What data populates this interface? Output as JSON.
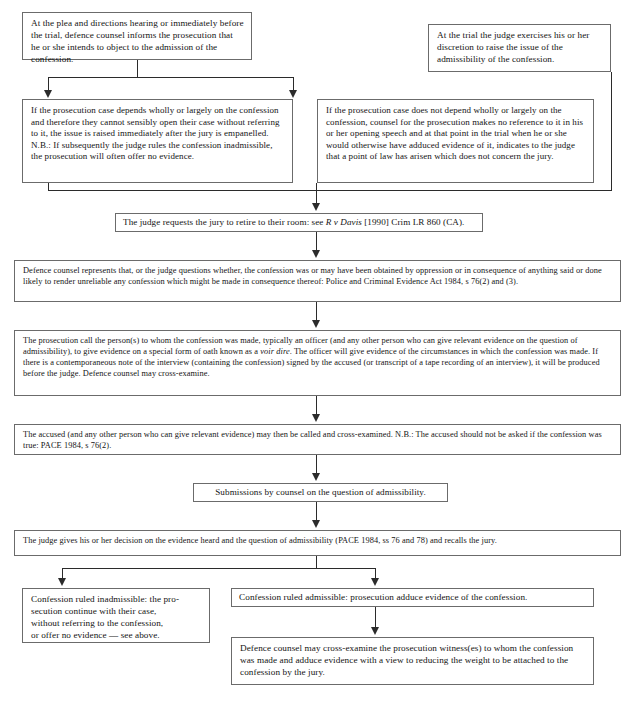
{
  "document": {
    "type": "flowchart",
    "title": "Procedure for determining the admissibility of a confession",
    "orientation": "top-to-bottom"
  },
  "nodes": {
    "plea_hearing": {
      "id": "plea-hearing",
      "text": "At the plea and directions hearing or immediately before the trial, defence counsel informs the prosecution that he or she intends to object to the admission of the confession."
    },
    "at_trial": {
      "id": "at-trial",
      "text": "At the trial the judge exercises his or her discretion to raise the issue of the admissibility of the confession."
    },
    "depends_wholly": {
      "id": "depends-wholly",
      "text": "If the prosecution case depends wholly or largely on the confession and therefore they cannot sensibly open their case without referring to it, the issue is raised immediately after the jury is empanelled. N.B.: If subsequently the judge rules the confession inadmissible, the prosecution will often offer no evidence."
    },
    "not_depends_wholly": {
      "id": "not-depends-wholly",
      "text": "If the prosecution case does not depend wholly or largely on the confession, counsel for the prosecution makes no reference to it in his or her opening speech and at that point in the trial when he or she would otherwise have adduced evidence of it, indicates to the judge that a point of law has arisen which does not concern the jury."
    },
    "jury_retire": {
      "id": "jury-retire",
      "text_before": "The judge requests the jury to retire to their room: see ",
      "citation_italic": "R v Davis",
      "text_after": " [1990] Crim LR 860 (CA)."
    },
    "defence_represents": {
      "id": "defence-represents",
      "text": "Defence counsel represents that, or the judge questions whether, the confession was or may have been obtained by oppression or in consequence of anything said or done likely to render unreliable any confession which might be made in consequence thereof: Police and Criminal Evidence Act 1984, s 76(2) and (3)."
    },
    "prosecution_call": {
      "id": "prosecution-call",
      "text_before": "The prosecution call the person(s) to whom the confession was made, typically an officer (and any other person who can give relevant evidence on the question of admissibility), to give evidence on a special form of oath known as a ",
      "term_italic": "voir dire",
      "text_after": ". The officer will give evidence of the circumstances in which the confession was made. If there is a contemporaneous note of the interview (containing the confession) signed by the accused (or transcript of a tape recording of an interview), it will be produced before the judge. Defence counsel may cross-examine."
    },
    "accused_called": {
      "id": "accused-called",
      "text": "The accused (and any other person who can give relevant evidence) may then be called and cross-examined. N.B.: The accused should not be asked if the confession was true: PACE 1984, s 76(2)."
    },
    "submissions": {
      "id": "submissions",
      "text": "Submissions by counsel on the question of admissibility."
    },
    "judge_decision": {
      "id": "judge-decision",
      "text": "The judge gives his or her decision on the evidence heard and the question of admissibility (PACE 1984, ss 76 and 78) and recalls the jury."
    },
    "ruled_inadmissible": {
      "id": "ruled-inadmissible",
      "lines": [
        "Confession ruled inadmissible: the pro-",
        "secution continue with their case,",
        "without referring to the confession,",
        "or offer no evidence — see above."
      ]
    },
    "ruled_admissible": {
      "id": "ruled-admissible",
      "text": "Confession ruled admissible: prosecution adduce evidence of the confession."
    },
    "defence_cross_examine": {
      "id": "defence-cross-examine",
      "text": "Defence counsel may cross-examine the prosecution witness(es) to whom the confession was made and adduce evidence with a view to reducing the weight to be attached to the confession by the jury."
    }
  },
  "colors": {
    "box_border": "#6b6b6b",
    "connector": "#2b2b2b",
    "background": "#ffffff",
    "text": "#141414"
  }
}
